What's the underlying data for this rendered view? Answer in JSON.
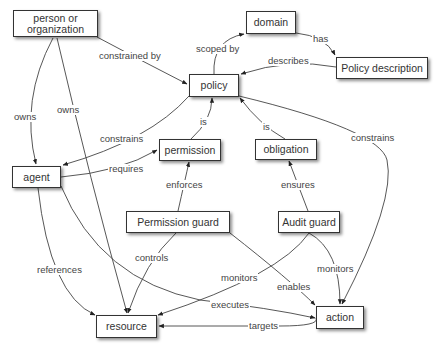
{
  "diagram": {
    "nodes": {
      "person": "person or organization",
      "domain": "domain",
      "policy_description": "Policy description",
      "policy": "policy",
      "permission": "permission",
      "obligation": "obligation",
      "agent": "agent",
      "permission_guard": "Permission guard",
      "audit_guard": "Audit guard",
      "resource": "resource",
      "action": "action"
    },
    "edges": {
      "person_constrained_by_policy": "constrained by",
      "person_owns_agent": "owns",
      "person_owns_resource": "owns",
      "policy_scoped_by_domain": "scoped by",
      "domain_has_description": "has",
      "description_describes_policy": "describes",
      "policy_constrains_agent": "constrains",
      "permission_is_policy": "is",
      "obligation_is_policy": "is",
      "policy_constrains_action": "constrains",
      "agent_requires_permission": "requires",
      "pguard_enforces_permission": "enforces",
      "aguard_ensures_obligation": "ensures",
      "agent_references_resource": "references",
      "pguard_controls_resource": "controls",
      "aguard_monitors_resource": "monitors",
      "aguard_monitors_action": "monitors",
      "pguard_enables_action": "enables",
      "agent_executes_action": "executes",
      "action_targets_resource": "targets"
    }
  }
}
